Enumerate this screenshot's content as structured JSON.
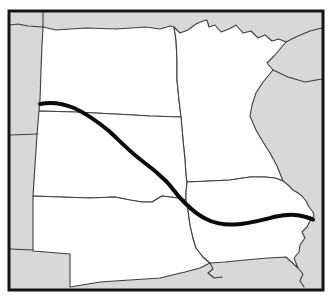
{
  "figure": {
    "kind": "outline-map",
    "description_semantic": "upper-midwest-states-outline-map-with-route-line",
    "canvas": {
      "width": 336,
      "height": 308,
      "background": "#ffffff"
    },
    "colors": {
      "surrounding_land_gray": "#d8d8d8",
      "highlight_land_white": "#ffffff",
      "thin_border_line": "#3d3d3d",
      "frame_border": "#141414",
      "route_line": "#0a0a0a"
    },
    "frame": {
      "x": 9,
      "y": 11,
      "width": 314,
      "height": 279,
      "stroke_width": 3
    },
    "regions": [
      {
        "name": "region-north-dakota",
        "points": "43,27 56,30 86,28 116,29 146,27 160,29 170,26 174,27 176,40 177,60 177,80 179,100 181,117 150,116 115,114 75,112 39,111 40,100 41,70 42,45"
      },
      {
        "name": "region-minnesota",
        "points": "174,27 180,33 188,30 196,24 203,21 207,20 209,27 215,25 221,32 229,29 236,25 243,33 251,31 258,38 265,35 272,41 279,39 286,42 280,49 274,56 267,63 273,70 263,82 256,93 252,105 250,116 256,130 263,142 270,153 277,166 283,181 275,178 265,177 250,177 230,180 210,181 187,182 186,176 185,160 183,140 181,117 179,100 177,80 177,60 176,40"
      },
      {
        "name": "region-south-dakota",
        "points": "39,111 75,112 115,114 150,116 181,117 183,140 185,160 186,176 187,182 186,192 186,200 178,198 170,197 162,196 152,202 142,202 130,200 115,197 90,198 60,197 33,196 35,165 37,135"
      },
      {
        "name": "region-nebraska",
        "points": "33,196 60,197 90,198 115,197 130,200 142,202 152,202 162,196 170,197 178,198 186,200 188,210 190,225 193,238 196,248 203,257 210,263 200,268 185,272 160,278 130,280 100,282 70,287 70,254 33,251"
      },
      {
        "name": "region-iowa",
        "points": "187,182 210,181 230,180 250,177 265,177 275,178 283,181 288,185 293,190 298,193 302,196 306,201 309,207 313,212 314,216 310,221 307,227 302,232 305,238 300,245 299,252 294,258 298,268 286,257 268,258 245,260 225,262 210,263 203,257 196,248 193,238 190,225 188,210 186,200 186,192"
      }
    ],
    "boundary_lines": [
      {
        "name": "border-canada-west-segment",
        "points": "10,25 18,24 28,26 43,27"
      },
      {
        "name": "border-montana-northdakota-north-segment",
        "points": "43,12 43,27"
      },
      {
        "name": "border-montana-wyoming",
        "points": "10,135 38,134"
      },
      {
        "name": "border-wyoming-south",
        "points": "10,249 33,250"
      },
      {
        "name": "border-lake-superior-corner-diagonal",
        "points": "286,42 298,36 310,31 322,28"
      },
      {
        "name": "border-wisconsin-north-line",
        "points": "273,70 288,77 305,82 322,79"
      },
      {
        "name": "border-missouri-northwest-jog",
        "points": "210,263 213,269 208,273 214,278 222,277"
      },
      {
        "name": "border-mississippi-below-iowa",
        "points": "298,268 303,274 300,281 304,287"
      }
    ],
    "route": {
      "name": "route-line",
      "stroke_width": 4,
      "start": {
        "x": 40,
        "y": 104
      },
      "end": {
        "x": 313,
        "y": 219
      },
      "path": "M 40,104 C 52,101.5 62,103 74,108 C 88,114 98,122 109,131 C 121,142 129,151 141,160 C 152,168 159,174 167,182 C 174,190 179,198 186,204 C 192,210 198,215 206,219 C 214,223 223,225 234,224.5 C 248,224 262,220 276,216.5 C 286,214.5 297,214.5 304,216.5 C 308,217.5 311,218.5 313,219.5"
    }
  }
}
